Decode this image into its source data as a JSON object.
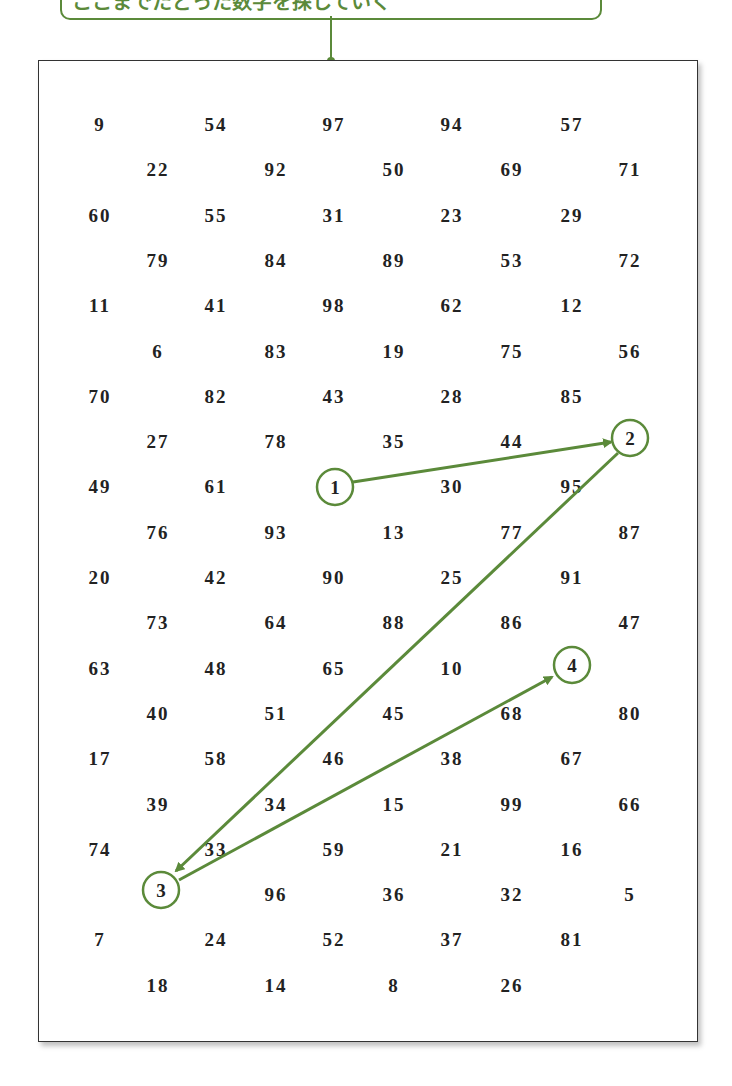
{
  "callout": {
    "text": "ここまでたどった数字を探していく",
    "color": "#5b8a3a"
  },
  "grid": {
    "rows": [
      [
        "9",
        "54",
        "97",
        "94",
        "57"
      ],
      [
        "22",
        "92",
        "50",
        "69",
        "71"
      ],
      [
        "60",
        "55",
        "31",
        "23",
        "29"
      ],
      [
        "79",
        "84",
        "89",
        "53",
        "72"
      ],
      [
        "11",
        "41",
        "98",
        "62",
        "12"
      ],
      [
        "6",
        "83",
        "19",
        "75",
        "56"
      ],
      [
        "70",
        "82",
        "43",
        "28",
        "85"
      ],
      [
        "27",
        "78",
        "35",
        "44",
        "2"
      ],
      [
        "49",
        "61",
        "1",
        "30",
        "95"
      ],
      [
        "76",
        "93",
        "13",
        "77",
        "87"
      ],
      [
        "20",
        "42",
        "90",
        "25",
        "91"
      ],
      [
        "73",
        "64",
        "88",
        "86",
        "47"
      ],
      [
        "63",
        "48",
        "65",
        "10",
        "4"
      ],
      [
        "40",
        "51",
        "45",
        "68",
        "80"
      ],
      [
        "17",
        "58",
        "46",
        "38",
        "67"
      ],
      [
        "39",
        "34",
        "15",
        "99",
        "66"
      ],
      [
        "74",
        "33",
        "59",
        "21",
        "16"
      ],
      [
        "3",
        "96",
        "36",
        "32",
        "5"
      ],
      [
        "7",
        "24",
        "52",
        "37",
        "81"
      ],
      [
        "18",
        "14",
        "8",
        "26"
      ]
    ]
  },
  "path": {
    "circled": [
      {
        "label": "1",
        "x": 335,
        "y": 487
      },
      {
        "label": "2",
        "x": 630,
        "y": 438
      },
      {
        "label": "3",
        "x": 161,
        "y": 890
      },
      {
        "label": "4",
        "x": 572,
        "y": 665
      }
    ],
    "accent_color": "#5b8a3a"
  }
}
